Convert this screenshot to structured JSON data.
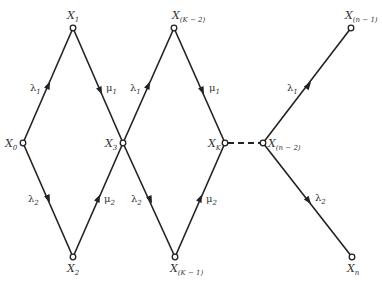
{
  "diagram": {
    "type": "state-transition-graph",
    "nodes": [
      {
        "id": "X0",
        "base": "X",
        "sub": "0",
        "x": 23,
        "y": 143
      },
      {
        "id": "X1",
        "base": "X",
        "sub": "1",
        "x": 73,
        "y": 28
      },
      {
        "id": "X2",
        "base": "X",
        "sub": "2",
        "x": 73,
        "y": 257
      },
      {
        "id": "X3",
        "base": "X",
        "sub": "3",
        "x": 123,
        "y": 143
      },
      {
        "id": "XK-2",
        "base": "X",
        "sub": "(K − 2)",
        "x": 174,
        "y": 28
      },
      {
        "id": "XK-1",
        "base": "X",
        "sub": "(K − 1)",
        "x": 175,
        "y": 257
      },
      {
        "id": "XK",
        "base": "X",
        "sub": "K",
        "x": 225,
        "y": 143
      },
      {
        "id": "Xn-2",
        "base": "X",
        "sub": "(n − 2)",
        "x": 263,
        "y": 143
      },
      {
        "id": "Xn-1",
        "base": "X",
        "sub": "(n − 1)",
        "x": 351,
        "y": 28
      },
      {
        "id": "Xn",
        "base": "X",
        "sub": "n",
        "x": 352,
        "y": 257
      }
    ],
    "edges": [
      {
        "from": "X0",
        "to": "X1",
        "rate": "λ",
        "rate_sub": "1",
        "style": "solid"
      },
      {
        "from": "X1",
        "to": "X3",
        "rate": "μ",
        "rate_sub": "1",
        "style": "solid"
      },
      {
        "from": "X0",
        "to": "X2",
        "rate": "λ",
        "rate_sub": "2",
        "style": "solid"
      },
      {
        "from": "X2",
        "to": "X3",
        "rate": "μ",
        "rate_sub": "2",
        "style": "solid"
      },
      {
        "from": "X3",
        "to": "XK-2",
        "rate": "λ",
        "rate_sub": "1",
        "style": "solid"
      },
      {
        "from": "XK-2",
        "to": "XK",
        "rate": "μ",
        "rate_sub": "1",
        "style": "solid"
      },
      {
        "from": "X3",
        "to": "XK-1",
        "rate": "λ",
        "rate_sub": "2",
        "style": "solid"
      },
      {
        "from": "XK-1",
        "to": "XK",
        "rate": "μ",
        "rate_sub": "2",
        "style": "solid"
      },
      {
        "from": "XK",
        "to": "Xn-2",
        "rate": "",
        "rate_sub": "",
        "style": "dashed"
      },
      {
        "from": "Xn-2",
        "to": "Xn-1",
        "rate": "λ",
        "rate_sub": "1",
        "style": "solid"
      },
      {
        "from": "Xn-2",
        "to": "Xn",
        "rate": "λ",
        "rate_sub": "2",
        "style": "solid"
      }
    ]
  },
  "labels": {
    "x0": {
      "base": "X",
      "sub": "0"
    },
    "x1": {
      "base": "X",
      "sub": "1"
    },
    "x2": {
      "base": "X",
      "sub": "2"
    },
    "x3": {
      "base": "X",
      "sub": "3"
    },
    "xk2": {
      "base": "X",
      "sub": "(K − 2)"
    },
    "xk1": {
      "base": "X",
      "sub": "(K − 1)"
    },
    "xk": {
      "base": "X",
      "sub": "K"
    },
    "xn2": {
      "base": "X",
      "sub": "(n − 2)"
    },
    "xn1": {
      "base": "X",
      "sub": "(n − 1)"
    },
    "xn": {
      "base": "X",
      "sub": "n"
    }
  },
  "rates": {
    "lambda": "λ",
    "mu": "μ",
    "one": "1",
    "two": "2"
  }
}
